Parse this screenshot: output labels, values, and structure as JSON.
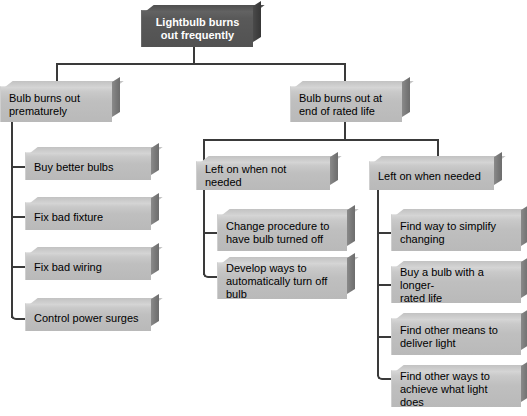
{
  "diagram": {
    "title": "Lightbulb burns out frequently",
    "type": "fault-tree",
    "root": {
      "label": "Lightbulb burns\nout frequently"
    },
    "branches": {
      "left": {
        "label": "Bulb burns out\nprematurely",
        "children": [
          {
            "label": "Buy better bulbs"
          },
          {
            "label": "Fix bad fixture"
          },
          {
            "label": "Fix bad wiring"
          },
          {
            "label": "Control power surges"
          }
        ]
      },
      "right": {
        "label": "Bulb burns out at\nend of rated life",
        "subbranches": [
          {
            "label": "Left on when not needed",
            "children": [
              {
                "label": "Change procedure to\nhave bulb turned off"
              },
              {
                "label": "Develop ways to\nautomatically turn off bulb"
              }
            ]
          },
          {
            "label": "Left on when needed",
            "children": [
              {
                "label": "Find way to simplify\nchanging"
              },
              {
                "label": "Buy a bulb with a longer-\nrated life"
              },
              {
                "label": "Find other means to\ndeliver light"
              },
              {
                "label": "Find other ways to\nachieve what light does"
              }
            ]
          }
        ]
      }
    },
    "colors": {
      "background": "#ffffff",
      "root_fill": "#565656",
      "root_text": "#ffffff",
      "node_fill": "#c2c2c2",
      "node_text": "#000000",
      "connector": "#3a3a3a",
      "shadow_face": "#777777"
    }
  }
}
